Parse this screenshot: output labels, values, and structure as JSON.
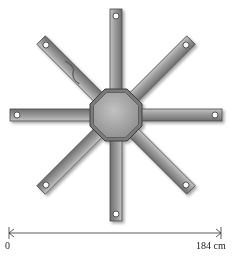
{
  "figure": {
    "type": "diagram",
    "arm_count": 8,
    "arm_angles_deg": [
      0,
      45,
      90,
      135,
      180,
      225,
      270,
      315
    ],
    "hub_shape": "octagon",
    "colors": {
      "arm_fill": "#8f8f8f",
      "arm_highlight": "#b9b9b9",
      "arm_edge": "#4a4a4a",
      "hub_fill": "#a8a8a8",
      "hole": "#ffffff",
      "scale_line": "#333333"
    }
  },
  "scale": {
    "start_label": "0",
    "end_label": "184 cm",
    "start_value": 0,
    "end_value": 184,
    "unit": "cm"
  }
}
